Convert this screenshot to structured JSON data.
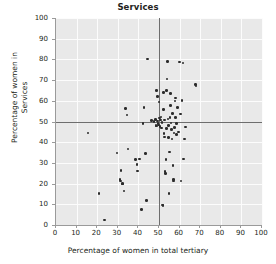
{
  "chart_data": {
    "type": "scatter",
    "title": "Services",
    "xlabel": "Percentage of women in total tertiary",
    "ylabel": "Percentage of women in Services",
    "xlim": [
      0,
      100
    ],
    "ylim": [
      0,
      100
    ],
    "xticks": [
      0,
      10,
      20,
      30,
      40,
      50,
      60,
      70,
      80,
      90,
      100
    ],
    "yticks": [
      0,
      10,
      20,
      30,
      40,
      50,
      60,
      70,
      80,
      90,
      100
    ],
    "grid": true,
    "legend": "none",
    "reference_lines": [
      {
        "orientation": "vertical",
        "value": 50
      },
      {
        "orientation": "horizontal",
        "value": 50
      }
    ],
    "marker_color": "#2b2b2b",
    "plot_background": "#e9e9e9",
    "points": [
      [
        15.6,
        44.5
      ],
      [
        20.8,
        15.3
      ],
      [
        23.4,
        2.5
      ],
      [
        29.6,
        34.8
      ],
      [
        31.0,
        22.0
      ],
      [
        31.3,
        21.3
      ],
      [
        31.6,
        26.3
      ],
      [
        32.2,
        19.9
      ],
      [
        32.4,
        20.1
      ],
      [
        33.1,
        16.4
      ],
      [
        33.6,
        56.4
      ],
      [
        34.5,
        53.2
      ],
      [
        35.0,
        36.7
      ],
      [
        38.5,
        31.5
      ],
      [
        39.4,
        29.3
      ],
      [
        39.6,
        26.1
      ],
      [
        40.5,
        31.9
      ],
      [
        41.4,
        7.4
      ],
      [
        42.2,
        48.9
      ],
      [
        42.8,
        56.8
      ],
      [
        43.4,
        34.6
      ],
      [
        44.0,
        11.8
      ],
      [
        44.4,
        80.1
      ],
      [
        46.5,
        50.4
      ],
      [
        47.5,
        49.9
      ],
      [
        48.3,
        51.1
      ],
      [
        48.5,
        48.0
      ],
      [
        48.7,
        47.9
      ],
      [
        48.9,
        64.9
      ],
      [
        49.2,
        62.1
      ],
      [
        49.4,
        50.2
      ],
      [
        49.6,
        49.1
      ],
      [
        49.8,
        48.4
      ],
      [
        50.0,
        59.5
      ],
      [
        50.2,
        51.6
      ],
      [
        50.4,
        47.6
      ],
      [
        50.6,
        50.8
      ],
      [
        50.9,
        52.2
      ],
      [
        51.1,
        46.9
      ],
      [
        51.4,
        49.6
      ],
      [
        51.6,
        9.6
      ],
      [
        51.9,
        9.3
      ],
      [
        52.1,
        63.9
      ],
      [
        52.3,
        55.8
      ],
      [
        52.4,
        44.1
      ],
      [
        52.6,
        42.6
      ],
      [
        52.8,
        50.7
      ],
      [
        53.0,
        25.8
      ],
      [
        53.1,
        24.9
      ],
      [
        53.3,
        31.7
      ],
      [
        53.5,
        46.5
      ],
      [
        53.7,
        65.1
      ],
      [
        53.9,
        70.6
      ],
      [
        54.1,
        78.9
      ],
      [
        54.3,
        51.3
      ],
      [
        54.5,
        48.2
      ],
      [
        54.7,
        42.3
      ],
      [
        54.9,
        15.3
      ],
      [
        55.1,
        35.3
      ],
      [
        55.3,
        52.0
      ],
      [
        55.5,
        57.6
      ],
      [
        55.7,
        63.6
      ],
      [
        55.9,
        49.3
      ],
      [
        56.1,
        46.1
      ],
      [
        56.3,
        41.6
      ],
      [
        56.5,
        53.9
      ],
      [
        56.7,
        28.8
      ],
      [
        56.9,
        21.9
      ],
      [
        57.1,
        21.3
      ],
      [
        57.3,
        44.4
      ],
      [
        57.5,
        47.2
      ],
      [
        57.7,
        59.9
      ],
      [
        57.9,
        61.3
      ],
      [
        58.1,
        51.8
      ],
      [
        58.4,
        43.6
      ],
      [
        58.6,
        49.0
      ],
      [
        59.0,
        56.9
      ],
      [
        59.4,
        45.0
      ],
      [
        60.0,
        78.8
      ],
      [
        60.3,
        53.7
      ],
      [
        60.6,
        21.2
      ],
      [
        61.1,
        60.1
      ],
      [
        61.6,
        78.3
      ],
      [
        62.0,
        31.8
      ],
      [
        62.4,
        41.6
      ],
      [
        63.0,
        47.3
      ],
      [
        67.8,
        67.9
      ],
      [
        68.0,
        67.1
      ]
    ]
  }
}
